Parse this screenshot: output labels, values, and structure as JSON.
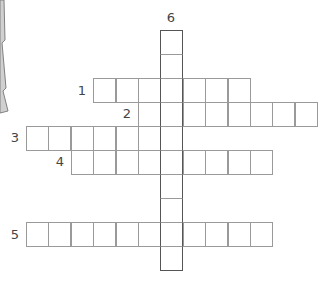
{
  "puzzle": {
    "type": "crossword",
    "cell_width": 22.4,
    "cell_height": 24,
    "origin_x": 26,
    "origin_y": 30,
    "colors": {
      "cell_border": "#9a9a9a",
      "down_border": "#555555",
      "label": "#444444",
      "decoration_fill": "#d0d0d0",
      "decoration_stroke": "#808080"
    },
    "down_column": 6,
    "entries": [
      {
        "number": "1",
        "direction": "across",
        "row": 2,
        "col": 3,
        "length": 7,
        "label_x": 82,
        "label_y": 90
      },
      {
        "number": "2",
        "direction": "across",
        "row": 3,
        "col": 5,
        "length": 8,
        "label_x": 127,
        "label_y": 113
      },
      {
        "number": "3",
        "direction": "across",
        "row": 4,
        "col": 0,
        "length": 7,
        "label_x": 15,
        "label_y": 137
      },
      {
        "number": "4",
        "direction": "across",
        "row": 5,
        "col": 2,
        "length": 9,
        "label_x": 60,
        "label_y": 161
      },
      {
        "number": "5",
        "direction": "across",
        "row": 8,
        "col": 0,
        "length": 11,
        "label_x": 15,
        "label_y": 234
      },
      {
        "number": "6",
        "direction": "down",
        "row": 0,
        "col": 6,
        "length": 10,
        "label_x": 171,
        "label_y": 17
      }
    ]
  },
  "decoration": {
    "name": "jagged-tree-edge",
    "points": "0,0 4,0 5,40 2,43 6,88 3,91 8,111 0,113"
  }
}
